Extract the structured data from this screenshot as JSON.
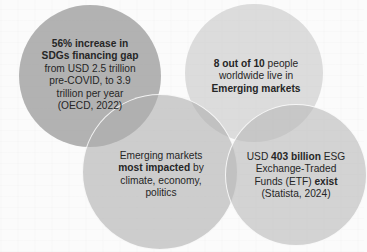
{
  "diagram": {
    "type": "overlapping-circles",
    "colors": {
      "background": "#fbfbfb",
      "circle_dark": "#969696",
      "circle_light": "#cccccc",
      "circle_mid": "#b5b5b5",
      "text": "#262626",
      "outline": "#ffffff"
    },
    "circles": [
      {
        "id": "sdg-financing-gap",
        "line1_bold": "56% increase in",
        "line2_bold": "SDGs financing gap",
        "line3": "from USD 2.5 trillion",
        "line4": "pre-COVID, to 3.9",
        "line5": "trillion per year",
        "line6": "(OECD, 2022)"
      },
      {
        "id": "population-emerging-markets",
        "line1_bold": "8 out of 10",
        "line1_rest": " people",
        "line2": "worldwide live in",
        "line3_bold": "Emerging markets"
      },
      {
        "id": "emerging-markets-impact",
        "line1": "Emerging markets",
        "line2_bold": "most impacted",
        "line2_rest": " by",
        "line3": "climate, economy,",
        "line4": "politics"
      },
      {
        "id": "esg-etf",
        "line1_pre": "USD ",
        "line1_bold": "403 billion",
        "line1_post": " ESG",
        "line2": "Exchange-Traded",
        "line3_pre": "Funds (ETF) ",
        "line3_bold": "exist",
        "line4": "(Statista, 2024)"
      }
    ]
  }
}
